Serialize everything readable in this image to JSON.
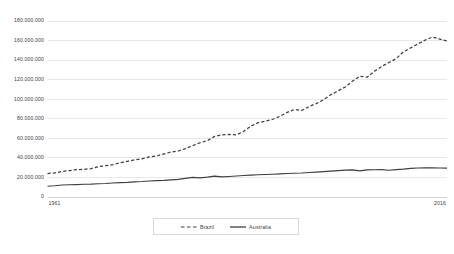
{
  "chart_data": {
    "type": "line",
    "title": "",
    "subtitle": "",
    "xlabel": "",
    "ylabel": "",
    "xlim": [
      1961,
      2016
    ],
    "ylim": [
      0,
      180000000
    ],
    "grid": true,
    "grid_axis": "y",
    "legend_position": "bottom-center",
    "y_ticks": [
      0,
      20000000,
      40000000,
      60000000,
      80000000,
      100000000,
      120000000,
      140000000,
      160000000,
      180000000
    ],
    "y_tick_labels": [
      "0",
      "20.000.000",
      "40.000.000",
      "60.000.000",
      "80.000.000",
      "100.000.000",
      "120.000.000",
      "140.000.000",
      "160.000.000",
      "180.000.000"
    ],
    "x_ticks": [
      1961,
      2016
    ],
    "x_tick_labels": [
      "1961",
      "2016"
    ],
    "x": [
      1961,
      1962,
      1963,
      1964,
      1965,
      1966,
      1967,
      1968,
      1969,
      1970,
      1971,
      1972,
      1973,
      1974,
      1975,
      1976,
      1977,
      1978,
      1979,
      1980,
      1981,
      1982,
      1983,
      1984,
      1985,
      1986,
      1987,
      1988,
      1989,
      1990,
      1991,
      1992,
      1993,
      1994,
      1995,
      1996,
      1997,
      1998,
      1999,
      2000,
      2001,
      2002,
      2003,
      2004,
      2005,
      2006,
      2007,
      2008,
      2009,
      2010,
      2011,
      2012,
      2013,
      2014,
      2015,
      2016
    ],
    "series": [
      {
        "name": "Brazil",
        "style": "dashed",
        "color": "#3f3f3f",
        "values": [
          23500000,
          24200000,
          25500000,
          26500000,
          27500000,
          27800000,
          28500000,
          30500000,
          31500000,
          32500000,
          34500000,
          36000000,
          37500000,
          38500000,
          40500000,
          41500000,
          43500000,
          45500000,
          46500000,
          49000000,
          52000000,
          55000000,
          57000000,
          61500000,
          63000000,
          63500000,
          63000000,
          66500000,
          72000000,
          75500000,
          77000000,
          79000000,
          82000000,
          86000000,
          89000000,
          88000000,
          92000000,
          95000000,
          99000000,
          104000000,
          108000000,
          112000000,
          118000000,
          123000000,
          122000000,
          128000000,
          133000000,
          137000000,
          141000000,
          148000000,
          152000000,
          156000000,
          160000000,
          163000000,
          161000000,
          159000000
        ]
      },
      {
        "name": "Australia",
        "style": "solid",
        "color": "#3f3f3f",
        "values": [
          10500000,
          11000000,
          11800000,
          12000000,
          12200000,
          12500000,
          12600000,
          13000000,
          13300000,
          13800000,
          14200000,
          14500000,
          15000000,
          15300000,
          15800000,
          16200000,
          16500000,
          17000000,
          17500000,
          18500000,
          19500000,
          19000000,
          19800000,
          20800000,
          20000000,
          20500000,
          21000000,
          21500000,
          21800000,
          22200000,
          22500000,
          22800000,
          23200000,
          23500000,
          23800000,
          24000000,
          24500000,
          25000000,
          25500000,
          26000000,
          26500000,
          27000000,
          27200000,
          26200000,
          27200000,
          27400000,
          27500000,
          26800000,
          27500000,
          28000000,
          28800000,
          29200000,
          29300000,
          29300000,
          29200000,
          29000000
        ]
      }
    ]
  }
}
